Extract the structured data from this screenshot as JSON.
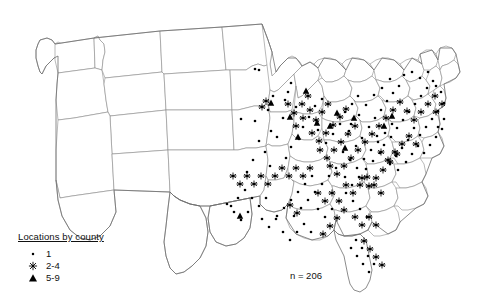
{
  "chart_data": {
    "type": "scatter",
    "title": "",
    "subtitle": "",
    "xlabel": "",
    "ylabel": "",
    "projection": "United States, contiguous 48 states",
    "grid": false,
    "legend_position": "bottom-left",
    "annotation": "n = 206",
    "total_locations": 206,
    "legend": {
      "title": "Locations by county",
      "entries": [
        {
          "marker": "dot",
          "label": "1",
          "min": 1,
          "max": 1
        },
        {
          "marker": "asterisk",
          "label": "2-4",
          "min": 2,
          "max": 4
        },
        {
          "marker": "triangle",
          "label": "5-9",
          "min": 5,
          "max": 9
        }
      ]
    },
    "series": [
      {
        "name": "1 location",
        "marker": "dot",
        "points": [
          [
            255,
            69
          ],
          [
            259,
            70
          ],
          [
            268,
            110
          ],
          [
            255,
            121
          ],
          [
            241,
            119
          ],
          [
            273,
            96
          ],
          [
            288,
            92
          ],
          [
            291,
            83
          ],
          [
            285,
            100
          ],
          [
            296,
            107
          ],
          [
            283,
            118
          ],
          [
            271,
            131
          ],
          [
            259,
            141
          ],
          [
            277,
            137
          ],
          [
            265,
            152
          ],
          [
            253,
            160
          ],
          [
            247,
            172
          ],
          [
            270,
            166
          ],
          [
            286,
            158
          ],
          [
            291,
            147
          ],
          [
            299,
            139
          ],
          [
            303,
            127
          ],
          [
            309,
            117
          ],
          [
            315,
            106
          ],
          [
            322,
            99
          ],
          [
            318,
            130
          ],
          [
            326,
            143
          ],
          [
            333,
            134
          ],
          [
            340,
            124
          ],
          [
            345,
            112
          ],
          [
            352,
            104
          ],
          [
            358,
            96
          ],
          [
            349,
            131
          ],
          [
            356,
            146
          ],
          [
            362,
            138
          ],
          [
            369,
            127
          ],
          [
            375,
            118
          ],
          [
            381,
            110
          ],
          [
            387,
            101
          ],
          [
            393,
            93
          ],
          [
            377,
            136
          ],
          [
            384,
            145
          ],
          [
            391,
            137
          ],
          [
            397,
            128
          ],
          [
            403,
            120
          ],
          [
            409,
            112
          ],
          [
            415,
            104
          ],
          [
            421,
            96
          ],
          [
            427,
            88
          ],
          [
            433,
            81
          ],
          [
            404,
            75
          ],
          [
            412,
            72
          ],
          [
            420,
            78
          ],
          [
            428,
            72
          ],
          [
            436,
            86
          ],
          [
            441,
            92
          ],
          [
            399,
            86
          ],
          [
            390,
            79
          ],
          [
            382,
            88
          ],
          [
            374,
            95
          ],
          [
            366,
            105
          ],
          [
            359,
            115
          ],
          [
            351,
            124
          ],
          [
            343,
            152
          ],
          [
            350,
            160
          ],
          [
            357,
            168
          ],
          [
            364,
            159
          ],
          [
            371,
            150
          ],
          [
            378,
            142
          ],
          [
            385,
            133
          ],
          [
            392,
            124
          ],
          [
            336,
            168
          ],
          [
            329,
            176
          ],
          [
            322,
            184
          ],
          [
            315,
            192
          ],
          [
            308,
            200
          ],
          [
            301,
            208
          ],
          [
            294,
            216
          ],
          [
            345,
            177
          ],
          [
            352,
            185
          ],
          [
            359,
            177
          ],
          [
            366,
            169
          ],
          [
            373,
            161
          ],
          [
            380,
            153
          ],
          [
            312,
            176
          ],
          [
            305,
            184
          ],
          [
            298,
            192
          ],
          [
            291,
            200
          ],
          [
            284,
            208
          ],
          [
            277,
            216
          ],
          [
            318,
            209
          ],
          [
            325,
            217
          ],
          [
            332,
            209
          ],
          [
            339,
            201
          ],
          [
            346,
            193
          ],
          [
            353,
            201
          ],
          [
            360,
            209
          ],
          [
            367,
            217
          ],
          [
            356,
            240
          ],
          [
            362,
            248
          ],
          [
            368,
            256
          ],
          [
            374,
            264
          ],
          [
            369,
            272
          ],
          [
            363,
            264
          ],
          [
            357,
            256
          ],
          [
            351,
            248
          ],
          [
            266,
            198
          ],
          [
            259,
            206
          ],
          [
            252,
            198
          ],
          [
            245,
            190
          ],
          [
            238,
            198
          ],
          [
            231,
            206
          ],
          [
            283,
            232
          ],
          [
            290,
            240
          ],
          [
            297,
            232
          ],
          [
            304,
            224
          ],
          [
            311,
            232
          ],
          [
            262,
            219
          ],
          [
            269,
            227
          ],
          [
            276,
            219
          ],
          [
            248,
            212
          ],
          [
            241,
            220
          ],
          [
            234,
            212
          ],
          [
            227,
            204
          ],
          [
            414,
            128
          ],
          [
            420,
            135
          ],
          [
            426,
            127
          ],
          [
            432,
            119
          ],
          [
            438,
            111
          ],
          [
            444,
            103
          ],
          [
            408,
            140
          ],
          [
            402,
            148
          ],
          [
            396,
            156
          ],
          [
            390,
            164
          ],
          [
            398,
            170
          ],
          [
            406,
            162
          ],
          [
            412,
            154
          ],
          [
            418,
            146
          ],
          [
            424,
            153
          ],
          [
            430,
            145
          ],
          [
            436,
            137
          ],
          [
            442,
            129
          ],
          [
            444,
            119
          ],
          [
            438,
            127
          ]
        ]
      },
      {
        "name": "2-4 locations",
        "marker": "asterisk",
        "points": [
          [
            262,
            107
          ],
          [
            266,
            101
          ],
          [
            288,
            104
          ],
          [
            294,
            113
          ],
          [
            302,
            104
          ],
          [
            308,
            96
          ],
          [
            296,
            126
          ],
          [
            303,
            118
          ],
          [
            310,
            110
          ],
          [
            316,
            120
          ],
          [
            322,
            112
          ],
          [
            328,
            104
          ],
          [
            312,
            133
          ],
          [
            319,
            141
          ],
          [
            326,
            133
          ],
          [
            333,
            125
          ],
          [
            340,
            117
          ],
          [
            346,
            109
          ],
          [
            320,
            150
          ],
          [
            327,
            158
          ],
          [
            334,
            150
          ],
          [
            341,
            142
          ],
          [
            348,
            134
          ],
          [
            355,
            126
          ],
          [
            330,
            166
          ],
          [
            337,
            174
          ],
          [
            344,
            166
          ],
          [
            351,
            158
          ],
          [
            358,
            150
          ],
          [
            365,
            142
          ],
          [
            362,
            178
          ],
          [
            369,
            186
          ],
          [
            376,
            178
          ],
          [
            383,
            170
          ],
          [
            390,
            162
          ],
          [
            397,
            154
          ],
          [
            372,
            134
          ],
          [
            379,
            126
          ],
          [
            386,
            118
          ],
          [
            393,
            110
          ],
          [
            400,
            102
          ],
          [
            407,
            111
          ],
          [
            381,
            152
          ],
          [
            388,
            160
          ],
          [
            395,
            152
          ],
          [
            402,
            144
          ],
          [
            409,
            136
          ],
          [
            416,
            144
          ],
          [
            346,
            185
          ],
          [
            353,
            193
          ],
          [
            360,
            185
          ],
          [
            367,
            177
          ],
          [
            374,
            185
          ],
          [
            381,
            193
          ],
          [
            318,
            193
          ],
          [
            325,
            201
          ],
          [
            332,
            193
          ],
          [
            339,
            201
          ],
          [
            310,
            168
          ],
          [
            303,
            176
          ],
          [
            296,
            168
          ],
          [
            289,
            176
          ],
          [
            282,
            168
          ],
          [
            275,
            176
          ],
          [
            268,
            184
          ],
          [
            261,
            176
          ],
          [
            254,
            184
          ],
          [
            247,
            176
          ],
          [
            240,
            184
          ],
          [
            233,
            176
          ],
          [
            290,
            205
          ],
          [
            297,
            213
          ],
          [
            355,
            217
          ],
          [
            362,
            225
          ],
          [
            369,
            217
          ],
          [
            376,
            225
          ],
          [
            364,
            241
          ],
          [
            370,
            249
          ],
          [
            376,
            257
          ],
          [
            382,
            265
          ],
          [
            344,
            210
          ],
          [
            337,
            218
          ],
          [
            330,
            226
          ],
          [
            323,
            234
          ],
          [
            414,
            120
          ],
          [
            421,
            112
          ],
          [
            428,
            104
          ],
          [
            435,
            96
          ],
          [
            442,
            104
          ],
          [
            436,
            112
          ]
        ]
      },
      {
        "name": "5-9 locations",
        "marker": "triangle",
        "points": [
          [
            271,
            103
          ],
          [
            306,
            91
          ],
          [
            317,
            123
          ],
          [
            330,
            126
          ],
          [
            337,
            113
          ],
          [
            345,
            148
          ],
          [
            290,
            117
          ],
          [
            298,
            137
          ],
          [
            240,
            216
          ],
          [
            384,
            126
          ],
          [
            392,
            116
          ],
          [
            354,
            118
          ]
        ]
      }
    ]
  }
}
